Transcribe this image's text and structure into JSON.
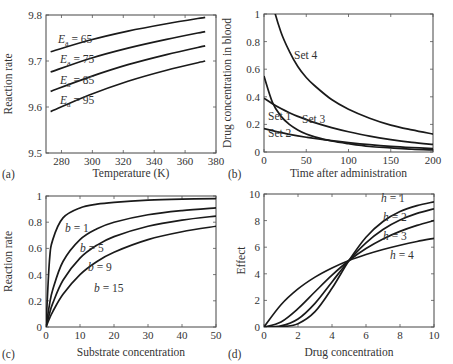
{
  "chart_data": [
    {
      "panel": "(a)",
      "type": "line",
      "title": "",
      "xlabel": "Temperature (K)",
      "ylabel": "Reaction rate",
      "xlim": [
        270,
        380
      ],
      "ylim": [
        9.5,
        9.8
      ],
      "xticks": [
        280,
        300,
        320,
        340,
        360,
        380
      ],
      "yticks": [
        9.5,
        9.6,
        9.7,
        9.8
      ],
      "ytick_labels": [
        "9.5",
        "9.6",
        "9.7",
        "9.8"
      ],
      "grid": false,
      "legend": "inline labels",
      "x": [
        273,
        298,
        323,
        348,
        373
      ],
      "series": [
        {
          "name": "Ea = 65",
          "label_main": "E",
          "label_sub": "a",
          "label_rest": " = 65",
          "values": [
            9.72,
            9.745,
            9.765,
            9.781,
            9.795
          ]
        },
        {
          "name": "Ea = 75",
          "label_main": "E",
          "label_sub": "a",
          "label_rest": " = 75",
          "values": [
            9.676,
            9.705,
            9.728,
            9.747,
            9.764
          ]
        },
        {
          "name": "Ea = 85",
          "label_main": "E",
          "label_sub": "a",
          "label_rest": " = 85",
          "values": [
            9.634,
            9.665,
            9.692,
            9.714,
            9.733
          ]
        },
        {
          "name": "Ea = 95",
          "label_main": "E",
          "label_sub": "a",
          "label_rest": " = 95",
          "values": [
            9.59,
            9.626,
            9.656,
            9.68,
            9.7
          ]
        }
      ]
    },
    {
      "panel": "(b)",
      "type": "line",
      "title": "",
      "xlabel": "Time after administration",
      "ylabel": "Drug concentration in blood",
      "xlim": [
        0,
        200
      ],
      "ylim": [
        0,
        1
      ],
      "xticks": [
        0,
        50,
        100,
        150,
        200
      ],
      "yticks": [
        0,
        0.2,
        0.4,
        0.6,
        0.8,
        1
      ],
      "ytick_labels": [
        "0",
        "0.2",
        "0.4",
        "0.6",
        "0.8",
        "1"
      ],
      "grid": false,
      "legend": "inline labels",
      "x": [
        0,
        10,
        20,
        30,
        40,
        50,
        60,
        80,
        100,
        125,
        150,
        175,
        200
      ],
      "series": [
        {
          "name": "Set 1",
          "values": [
            0.55,
            0.36,
            0.26,
            0.2,
            0.16,
            0.13,
            0.11,
            0.08,
            0.06,
            0.04,
            0.03,
            0.02,
            0.015
          ]
        },
        {
          "name": "Set 2",
          "values": [
            0.17,
            0.155,
            0.14,
            0.128,
            0.117,
            0.107,
            0.098,
            0.082,
            0.068,
            0.053,
            0.041,
            0.032,
            0.025
          ]
        },
        {
          "name": "Set 3",
          "values": [
            0.39,
            0.35,
            0.315,
            0.285,
            0.258,
            0.235,
            0.213,
            0.177,
            0.147,
            0.115,
            0.09,
            0.07,
            0.055
          ]
        },
        {
          "name": "Set 4",
          "values": [
            1.4,
            1.08,
            0.87,
            0.73,
            0.62,
            0.54,
            0.48,
            0.38,
            0.31,
            0.245,
            0.195,
            0.16,
            0.13
          ]
        }
      ]
    },
    {
      "panel": "(c)",
      "type": "line",
      "title": "",
      "xlabel": "Substrate concentration",
      "ylabel": "Reaction rate",
      "xlim": [
        0,
        50
      ],
      "ylim": [
        0,
        1
      ],
      "xticks": [
        0,
        10,
        20,
        30,
        40,
        50
      ],
      "yticks": [
        0,
        0.2,
        0.4,
        0.6,
        0.8,
        1
      ],
      "ytick_labels": [
        "0",
        "0.2",
        "0.4",
        "0.6",
        "0.8",
        "1"
      ],
      "grid": false,
      "legend": "inline labels",
      "x": [
        0,
        1,
        2,
        5,
        10,
        15,
        20,
        30,
        40,
        50
      ],
      "series": [
        {
          "name": "b = 1",
          "values": [
            0,
            0.5,
            0.667,
            0.833,
            0.909,
            0.938,
            0.952,
            0.968,
            0.976,
            0.98
          ]
        },
        {
          "name": "b = 5",
          "values": [
            0,
            0.167,
            0.286,
            0.5,
            0.667,
            0.75,
            0.8,
            0.857,
            0.889,
            0.909
          ]
        },
        {
          "name": "b = 9",
          "values": [
            0,
            0.1,
            0.182,
            0.357,
            0.526,
            0.625,
            0.69,
            0.769,
            0.816,
            0.847
          ]
        },
        {
          "name": "b = 15",
          "values": [
            0,
            0.063,
            0.118,
            0.25,
            0.4,
            0.5,
            0.571,
            0.667,
            0.727,
            0.769
          ]
        }
      ]
    },
    {
      "panel": "(d)",
      "type": "line",
      "title": "",
      "xlabel": "Drug concentration",
      "ylabel": "Effect",
      "xlim": [
        0,
        10
      ],
      "ylim": [
        0,
        10
      ],
      "xticks": [
        0,
        2,
        4,
        6,
        8,
        10
      ],
      "yticks": [
        0,
        2,
        4,
        6,
        8,
        10
      ],
      "ytick_labels": [
        "0",
        "2",
        "4",
        "6",
        "8",
        "10"
      ],
      "grid": false,
      "legend": "inline labels",
      "x": [
        0,
        1,
        2,
        3,
        4,
        5,
        6,
        7,
        8,
        9,
        10
      ],
      "series": [
        {
          "name": "h = 1",
          "values": [
            0,
            1.67,
            2.86,
            3.75,
            4.44,
            5.0,
            5.45,
            5.83,
            6.15,
            6.43,
            6.67
          ]
        },
        {
          "name": "h = 2",
          "values": [
            0,
            0.38,
            1.38,
            2.65,
            3.9,
            5.0,
            5.9,
            6.62,
            7.19,
            7.64,
            8.0
          ]
        },
        {
          "name": "h = 3",
          "values": [
            0,
            0.08,
            0.6,
            1.78,
            3.39,
            5.0,
            6.33,
            7.33,
            8.04,
            8.54,
            8.89
          ]
        },
        {
          "name": "h = 4",
          "values": [
            0,
            0.02,
            0.25,
            1.15,
            2.91,
            5.0,
            6.75,
            7.93,
            8.68,
            9.13,
            9.41
          ]
        }
      ]
    }
  ],
  "panels": [
    {
      "id": "a",
      "letter": "(a)"
    },
    {
      "id": "b",
      "letter": "(b)"
    },
    {
      "id": "c",
      "letter": "(c)"
    },
    {
      "id": "d",
      "letter": "(d)"
    }
  ]
}
